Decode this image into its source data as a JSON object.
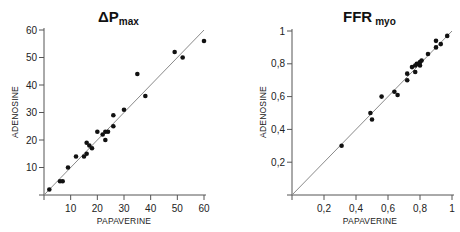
{
  "chart_data": [
    {
      "type": "scatter",
      "title": "ΔP",
      "title_subscript": "max",
      "xlabel": "PAPAVERINE",
      "ylabel": "ADENOSINE",
      "xlim": [
        0,
        60
      ],
      "ylim": [
        0,
        60
      ],
      "xticks": [
        10,
        20,
        30,
        40,
        50,
        60
      ],
      "xtick_labels": [
        "10",
        "20",
        "30",
        "40",
        "50",
        "60"
      ],
      "yticks": [
        10,
        20,
        30,
        40,
        50,
        60
      ],
      "ytick_labels": [
        "10",
        "20",
        "30",
        "40",
        "50",
        "60"
      ],
      "grid": false,
      "identity_line": true,
      "points": [
        [
          2,
          2
        ],
        [
          6,
          5
        ],
        [
          7,
          5
        ],
        [
          9,
          10
        ],
        [
          12,
          14
        ],
        [
          15,
          14
        ],
        [
          16,
          15
        ],
        [
          16,
          19
        ],
        [
          17,
          18
        ],
        [
          18,
          17
        ],
        [
          20,
          23
        ],
        [
          22,
          22
        ],
        [
          23,
          23
        ],
        [
          23,
          20
        ],
        [
          24,
          23
        ],
        [
          26,
          25
        ],
        [
          26,
          29
        ],
        [
          30,
          31
        ],
        [
          35,
          44
        ],
        [
          38,
          36
        ],
        [
          49,
          52
        ],
        [
          52,
          50
        ],
        [
          60,
          56
        ]
      ]
    },
    {
      "type": "scatter",
      "title": "FFR",
      "title_subscript": "myo",
      "xlabel": "PAPAVERINE",
      "ylabel": "ADENOSINE",
      "xlim": [
        0,
        1
      ],
      "ylim": [
        0,
        1
      ],
      "xticks": [
        0.2,
        0.4,
        0.6,
        0.8,
        1
      ],
      "xtick_labels": [
        "0,2",
        "0,4",
        "0,6",
        "0,8",
        "1"
      ],
      "yticks": [
        0.2,
        0.4,
        0.6,
        0.8,
        1
      ],
      "ytick_labels": [
        "0,2",
        "0,4",
        "0,6",
        "0,8",
        "1"
      ],
      "grid": false,
      "identity_line": true,
      "points": [
        [
          0.31,
          0.3
        ],
        [
          0.49,
          0.5
        ],
        [
          0.5,
          0.46
        ],
        [
          0.56,
          0.6
        ],
        [
          0.64,
          0.63
        ],
        [
          0.66,
          0.61
        ],
        [
          0.72,
          0.74
        ],
        [
          0.72,
          0.7
        ],
        [
          0.75,
          0.78
        ],
        [
          0.77,
          0.75
        ],
        [
          0.77,
          0.79
        ],
        [
          0.78,
          0.8
        ],
        [
          0.79,
          0.8
        ],
        [
          0.8,
          0.79
        ],
        [
          0.8,
          0.81
        ],
        [
          0.81,
          0.82
        ],
        [
          0.85,
          0.86
        ],
        [
          0.9,
          0.9
        ],
        [
          0.9,
          0.94
        ],
        [
          0.93,
          0.92
        ],
        [
          0.97,
          0.97
        ]
      ]
    }
  ],
  "colors": {
    "axis": "#555555",
    "identity_line": "#8a8a8a",
    "point": "#111111",
    "text": "#222222"
  }
}
